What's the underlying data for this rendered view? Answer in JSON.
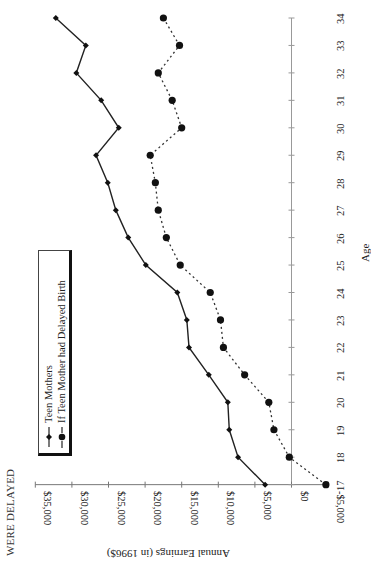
{
  "title": "WERE DELAYED",
  "chart_data": {
    "type": "line",
    "title": "WERE DELAYED",
    "xlabel": "Age",
    "ylabel": "Annual Earnings (in 1996$)",
    "orientation": "rotated 90 degrees (age axis vertical on right, earnings axis horizontal at bottom)",
    "ylim": [
      -5000,
      35000
    ],
    "y_ticks": [
      "$35,000",
      "$30,000",
      "$25,000",
      "$20,000",
      "$15,000",
      "$10,000",
      "$5,000",
      "$0",
      "-$5,000"
    ],
    "y_tick_values": [
      35000,
      30000,
      25000,
      20000,
      15000,
      10000,
      5000,
      0,
      -5000
    ],
    "x": [
      17,
      18,
      19,
      20,
      21,
      22,
      23,
      24,
      25,
      26,
      27,
      28,
      29,
      30,
      31,
      32,
      33,
      34
    ],
    "x_ticks": [
      "17",
      "18",
      "19",
      "20",
      "21",
      "22",
      "23",
      "24",
      "25",
      "26",
      "27",
      "28",
      "29",
      "30",
      "31",
      "32",
      "33",
      "34"
    ],
    "grid": false,
    "legend_position": "inside, upper-left region",
    "series": [
      {
        "name": "Teen Mothers",
        "style": "solid line, small diamond markers",
        "values": [
          3600,
          7300,
          8500,
          8700,
          11300,
          14000,
          14300,
          15600,
          19900,
          22300,
          24000,
          25100,
          26700,
          23600,
          26000,
          29400,
          28100,
          32200
        ]
      },
      {
        "name": "If Teen Mother had Delayed Birth",
        "style": "dotted/dashed line, large circle markers",
        "values": [
          -4700,
          300,
          2400,
          3100,
          6400,
          9300,
          9700,
          11100,
          15200,
          17100,
          18200,
          18600,
          19300,
          15000,
          16300,
          18200,
          15300,
          17500
        ]
      }
    ]
  },
  "legend": {
    "items": [
      {
        "label": "Teen Mothers"
      },
      {
        "label": "If Teen Mother had Delayed Birth"
      }
    ]
  }
}
